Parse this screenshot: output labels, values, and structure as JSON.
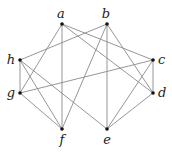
{
  "graph": {
    "vertices": [
      {
        "id": "a",
        "label": "a"
      },
      {
        "id": "b",
        "label": "b"
      },
      {
        "id": "c",
        "label": "c"
      },
      {
        "id": "d",
        "label": "d"
      },
      {
        "id": "e",
        "label": "e"
      },
      {
        "id": "f",
        "label": "f"
      },
      {
        "id": "g",
        "label": "g"
      },
      {
        "id": "h",
        "label": "h"
      }
    ],
    "edges": [
      [
        "a",
        "f"
      ],
      [
        "a",
        "g"
      ],
      [
        "a",
        "c"
      ],
      [
        "a",
        "d"
      ],
      [
        "b",
        "h"
      ],
      [
        "b",
        "f"
      ],
      [
        "b",
        "e"
      ],
      [
        "b",
        "d"
      ],
      [
        "h",
        "g"
      ],
      [
        "h",
        "f"
      ],
      [
        "h",
        "e"
      ],
      [
        "g",
        "c"
      ],
      [
        "g",
        "f"
      ],
      [
        "c",
        "d"
      ],
      [
        "c",
        "e"
      ],
      [
        "d",
        "e"
      ]
    ]
  }
}
